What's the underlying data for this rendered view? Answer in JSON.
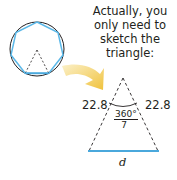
{
  "caption": "Actually, you only need to sketch the triangle:",
  "triangle": {
    "left_side": "22.8",
    "right_side": "22.8",
    "angle_numerator": "360°",
    "angle_denominator": "7",
    "base_label": "d"
  },
  "colors": {
    "heptagon": "#5bb8e8",
    "circle": "#231f20",
    "arrow": "#f2c84b",
    "base": "#4aa8dc"
  }
}
